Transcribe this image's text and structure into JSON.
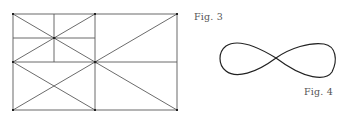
{
  "figures": [
    {
      "label": "Fig. 3",
      "description": "rectangle subdivided by grid lines and diagonals",
      "stroke_color": "#555555"
    },
    {
      "label": "Fig. 4",
      "description": "figure-eight lemniscate curve",
      "stroke_color": "#222222"
    }
  ]
}
